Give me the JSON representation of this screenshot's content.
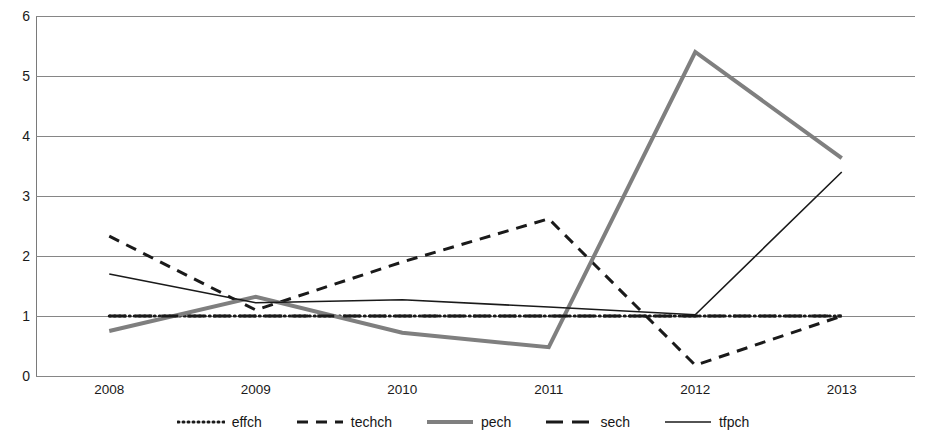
{
  "chart_data": {
    "type": "line",
    "title": "",
    "subtitle": "",
    "xlabel": "",
    "ylabel": "",
    "categories": [
      "2008",
      "2009",
      "2010",
      "2011",
      "2012",
      "2013"
    ],
    "ylim": [
      0,
      6
    ],
    "y_ticks": [
      0,
      1,
      2,
      3,
      4,
      5,
      6
    ],
    "y_tick_labels": [
      "0",
      "1",
      "2",
      "3",
      "4",
      "5",
      "6"
    ],
    "grid": true,
    "grid_axis": "y",
    "legend_position": "bottom",
    "series": [
      {
        "name": "effch",
        "values": [
          1.0,
          1.0,
          1.0,
          1.0,
          1.0,
          1.0
        ],
        "color": "#1a1a1a",
        "style": "dotted",
        "width": 3,
        "dasharray": "1 4"
      },
      {
        "name": "techch",
        "values": [
          2.33,
          1.1,
          1.9,
          2.62,
          0.18,
          1.0
        ],
        "color": "#1a1a1a",
        "style": "dashed",
        "width": 3,
        "dasharray": "11 8"
      },
      {
        "name": "pech",
        "values": [
          0.75,
          1.32,
          0.72,
          0.48,
          5.4,
          3.63
        ],
        "color": "#7f7f7f",
        "style": "solid",
        "width": 4,
        "dasharray": "none"
      },
      {
        "name": "sech",
        "values": [
          1.0,
          1.0,
          1.0,
          1.0,
          1.0,
          1.0
        ],
        "color": "#1a1a1a",
        "style": "long-dash",
        "width": 3.2,
        "dasharray": "17 9"
      },
      {
        "name": "tfpch",
        "values": [
          1.7,
          1.22,
          1.27,
          1.15,
          1.02,
          3.4
        ],
        "color": "#1a1a1a",
        "style": "solid",
        "width": 1.6,
        "dasharray": "none"
      }
    ]
  },
  "legend": {
    "items": [
      {
        "label": "effch"
      },
      {
        "label": "techch"
      },
      {
        "label": "pech"
      },
      {
        "label": "sech"
      },
      {
        "label": "tfpch"
      }
    ]
  },
  "colors": {
    "gridline": "#868686",
    "axis": "#7a7a7a",
    "text": "#1a1a1a",
    "background": "#ffffff",
    "pech_gray": "#7f7f7f"
  }
}
